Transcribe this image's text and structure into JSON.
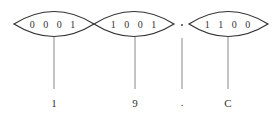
{
  "diagram": {
    "type": "binary-to-hex conversion",
    "groups": [
      {
        "bits": "0001",
        "bits_display": "0 0 0 1",
        "hex": "1"
      },
      {
        "bits": "1001",
        "bits_display": "1 0 0 1",
        "hex": "9"
      },
      {
        "separator": ".",
        "hex": "."
      },
      {
        "bits": "1100",
        "bits_display": "1 1 0 0",
        "hex": "C"
      }
    ],
    "stroke_color": "#333333",
    "line_color": "#888888"
  }
}
